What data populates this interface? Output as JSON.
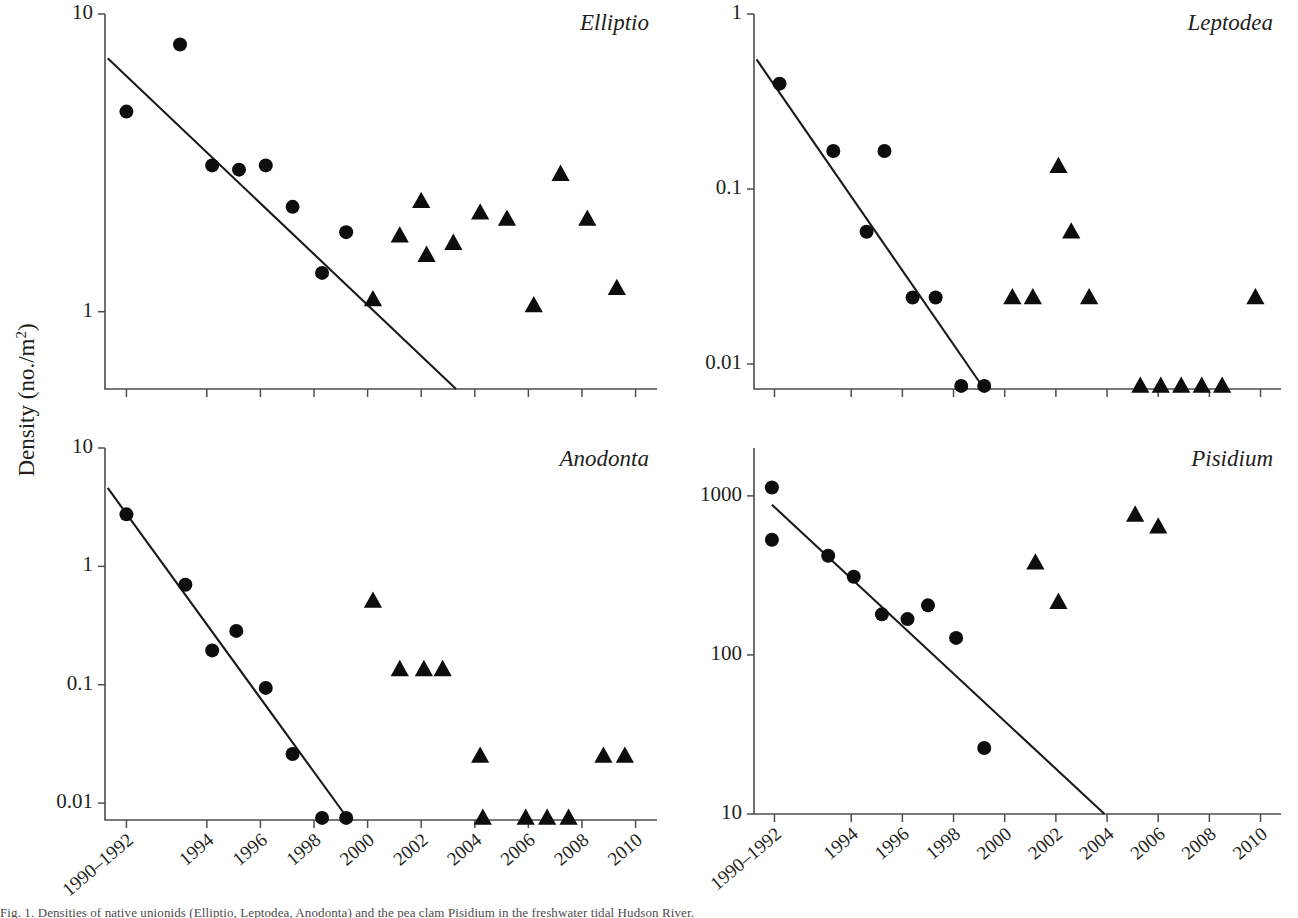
{
  "figure": {
    "y_axis_title": "Density (no./m",
    "y_axis_title_sup": "2",
    "y_axis_title_close": ")",
    "caption_partial": "Fig. 1. Densities of native unionids (Elliptio, Leptodea, Anodonta) and the pea clam Pisidium in the freshwater tidal Hudson River."
  },
  "x_axis": {
    "tick_labels": [
      "1990–1992",
      "1994",
      "1996",
      "1998",
      "2000",
      "2002",
      "2004",
      "2006",
      "2008",
      "2010"
    ],
    "tick_values": [
      1991,
      1994,
      1996,
      1998,
      2000,
      2002,
      2004,
      2006,
      2008,
      2010
    ],
    "min": 1990.2,
    "max": 2010.8
  },
  "chart_data": [
    {
      "type": "scatter",
      "title": "Elliptio",
      "xlabel": "",
      "ylabel": "Density (no./m2)",
      "log_y": true,
      "ylim": [
        0.55,
        10
      ],
      "ytick_values": [
        10,
        1
      ],
      "ytick_labels": [
        "10",
        "1"
      ],
      "series": [
        {
          "name": "pre-invasion",
          "marker": "circle",
          "points": [
            {
              "x": 1991.0,
              "y": 4.7
            },
            {
              "x": 1993.0,
              "y": 7.9
            },
            {
              "x": 1994.2,
              "y": 3.1
            },
            {
              "x": 1995.2,
              "y": 3.0
            },
            {
              "x": 1996.2,
              "y": 3.1
            },
            {
              "x": 1997.2,
              "y": 2.25
            },
            {
              "x": 1998.3,
              "y": 1.35
            },
            {
              "x": 1999.2,
              "y": 1.85
            }
          ]
        },
        {
          "name": "post-invasion",
          "marker": "triangle",
          "points": [
            {
              "x": 2000.2,
              "y": 1.1
            },
            {
              "x": 2001.2,
              "y": 1.8
            },
            {
              "x": 2002.2,
              "y": 1.55
            },
            {
              "x": 2002.0,
              "y": 2.35
            },
            {
              "x": 2003.2,
              "y": 1.7
            },
            {
              "x": 2004.2,
              "y": 2.15
            },
            {
              "x": 2005.2,
              "y": 2.05
            },
            {
              "x": 2006.2,
              "y": 1.05
            },
            {
              "x": 2007.2,
              "y": 2.9
            },
            {
              "x": 2008.2,
              "y": 2.05
            },
            {
              "x": 2009.3,
              "y": 1.2
            }
          ]
        }
      ],
      "fit_line": {
        "x1": 1990.3,
        "y1": 7.1,
        "x2": 2003.3,
        "y2": 0.55
      }
    },
    {
      "type": "scatter",
      "title": "Leptodea",
      "xlabel": "",
      "ylabel": "Density (no./m2)",
      "log_y": true,
      "ylim": [
        0.0072,
        1
      ],
      "ytick_values": [
        1,
        0.1,
        0.01
      ],
      "ytick_labels": [
        "1",
        "0.1",
        "0.01"
      ],
      "series": [
        {
          "name": "pre-invasion",
          "marker": "circle",
          "points": [
            {
              "x": 1991.2,
              "y": 0.4
            },
            {
              "x": 1993.3,
              "y": 0.165
            },
            {
              "x": 1994.6,
              "y": 0.057
            },
            {
              "x": 1995.3,
              "y": 0.165
            },
            {
              "x": 1996.4,
              "y": 0.024
            },
            {
              "x": 1997.3,
              "y": 0.024
            },
            {
              "x": 1998.3,
              "y": 0.0075
            },
            {
              "x": 1999.2,
              "y": 0.0075
            }
          ]
        },
        {
          "name": "post-invasion",
          "marker": "triangle",
          "points": [
            {
              "x": 2000.3,
              "y": 0.024
            },
            {
              "x": 2001.1,
              "y": 0.024
            },
            {
              "x": 2002.1,
              "y": 0.135
            },
            {
              "x": 2002.6,
              "y": 0.057
            },
            {
              "x": 2003.3,
              "y": 0.024
            },
            {
              "x": 2005.3,
              "y": 0.0075
            },
            {
              "x": 2006.1,
              "y": 0.0075
            },
            {
              "x": 2006.9,
              "y": 0.0075
            },
            {
              "x": 2007.7,
              "y": 0.0075
            },
            {
              "x": 2008.5,
              "y": 0.0075
            },
            {
              "x": 2009.8,
              "y": 0.024
            }
          ]
        }
      ],
      "fit_line": {
        "x1": 1990.3,
        "y1": 0.55,
        "x2": 1999.2,
        "y2": 0.0072
      }
    },
    {
      "type": "scatter",
      "title": "Anodonta",
      "xlabel": "",
      "ylabel": "Density (no./m2)",
      "log_y": true,
      "ylim": [
        0.0072,
        10
      ],
      "ytick_values": [
        10,
        1,
        0.1,
        0.01
      ],
      "ytick_labels": [
        "10",
        "1",
        "0.1",
        "0.01"
      ],
      "series": [
        {
          "name": "pre-invasion",
          "marker": "circle",
          "points": [
            {
              "x": 1991.0,
              "y": 2.75
            },
            {
              "x": 1993.2,
              "y": 0.7
            },
            {
              "x": 1994.2,
              "y": 0.195
            },
            {
              "x": 1995.1,
              "y": 0.285
            },
            {
              "x": 1996.2,
              "y": 0.094
            },
            {
              "x": 1997.2,
              "y": 0.026
            },
            {
              "x": 1998.3,
              "y": 0.0075
            },
            {
              "x": 1999.2,
              "y": 0.0075
            }
          ]
        },
        {
          "name": "post-invasion",
          "marker": "triangle",
          "points": [
            {
              "x": 2000.2,
              "y": 0.51
            },
            {
              "x": 2001.2,
              "y": 0.135
            },
            {
              "x": 2002.1,
              "y": 0.135
            },
            {
              "x": 2002.8,
              "y": 0.135
            },
            {
              "x": 2004.2,
              "y": 0.025
            },
            {
              "x": 2004.3,
              "y": 0.0075
            },
            {
              "x": 2005.9,
              "y": 0.0075
            },
            {
              "x": 2006.7,
              "y": 0.0075
            },
            {
              "x": 2007.5,
              "y": 0.0075
            },
            {
              "x": 2008.8,
              "y": 0.025
            },
            {
              "x": 2009.6,
              "y": 0.025
            }
          ]
        }
      ],
      "fit_line": {
        "x1": 1990.3,
        "y1": 4.6,
        "x2": 1999.3,
        "y2": 0.0072
      }
    },
    {
      "type": "scatter",
      "title": "Pisidium",
      "xlabel": "",
      "ylabel": "Density (no./m2)",
      "log_y": true,
      "ylim": [
        10,
        2000
      ],
      "ytick_values": [
        1000,
        100,
        10
      ],
      "ytick_labels": [
        "1000",
        "100",
        "10"
      ],
      "series": [
        {
          "name": "pre-invasion",
          "marker": "circle",
          "points": [
            {
              "x": 1990.9,
              "y": 1130
            },
            {
              "x": 1990.9,
              "y": 530
            },
            {
              "x": 1993.1,
              "y": 420
            },
            {
              "x": 1994.1,
              "y": 310
            },
            {
              "x": 1995.2,
              "y": 180
            },
            {
              "x": 1996.2,
              "y": 168
            },
            {
              "x": 1997.0,
              "y": 205
            },
            {
              "x": 1998.1,
              "y": 128
            },
            {
              "x": 1999.2,
              "y": 26
            }
          ]
        },
        {
          "name": "post-invasion",
          "marker": "triangle",
          "points": [
            {
              "x": 2001.2,
              "y": 380
            },
            {
              "x": 2002.1,
              "y": 215
            },
            {
              "x": 2005.1,
              "y": 760
            },
            {
              "x": 2006.0,
              "y": 640
            }
          ]
        }
      ],
      "fit_line": {
        "x1": 1990.9,
        "y1": 880,
        "x2": 2003.9,
        "y2": 10
      }
    }
  ]
}
